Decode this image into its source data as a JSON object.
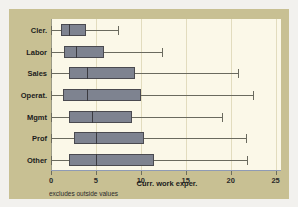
{
  "chart_data": {
    "type": "box",
    "title": "",
    "xlabel": "Curr. work exper.",
    "ylabel": "",
    "xlim": [
      0,
      25.6
    ],
    "xticks": [
      0,
      5,
      10,
      15,
      20,
      25
    ],
    "xticklabels": [
      "0",
      "5",
      "10",
      "15",
      "20",
      "25"
    ],
    "grid": true,
    "legend": false,
    "annotation": "excludes outside values",
    "categories": [
      "Cler.",
      "Labor",
      "Sales",
      "Operat.",
      "Mgmt",
      "Prof",
      "Other"
    ],
    "boxes": [
      {
        "category": "Cler.",
        "whisker_low": 0.0,
        "q1": 1.1,
        "median": 2.0,
        "q3": 3.9,
        "whisker_high": 7.5
      },
      {
        "category": "Labor",
        "whisker_low": 0.0,
        "q1": 1.5,
        "median": 2.8,
        "q3": 5.9,
        "whisker_high": 12.4
      },
      {
        "category": "Sales",
        "whisker_low": 0.0,
        "q1": 2.0,
        "median": 4.0,
        "q3": 9.3,
        "whisker_high": 20.8
      },
      {
        "category": "Operat.",
        "whisker_low": 0.0,
        "q1": 1.3,
        "median": 4.0,
        "q3": 10.0,
        "whisker_high": 22.5
      },
      {
        "category": "Mgmt",
        "whisker_low": 0.0,
        "q1": 2.0,
        "median": 4.6,
        "q3": 9.0,
        "whisker_high": 19.0
      },
      {
        "category": "Prof",
        "whisker_low": 0.0,
        "q1": 2.6,
        "median": 5.0,
        "q3": 10.3,
        "whisker_high": 21.7
      },
      {
        "category": "Other",
        "whisker_low": 0.0,
        "q1": 2.0,
        "median": 5.0,
        "q3": 11.5,
        "whisker_high": 21.8
      }
    ]
  },
  "colors": {
    "page_background": "#f2f1ee",
    "frame_background": "#c8c093",
    "plot_background": "#fbf8e8",
    "box_fill": "#7e8390",
    "box_border": "#4a4a50",
    "gridline": "#e2dcbe",
    "axis": "#8f9bb5",
    "text": "#1c1c1c"
  }
}
